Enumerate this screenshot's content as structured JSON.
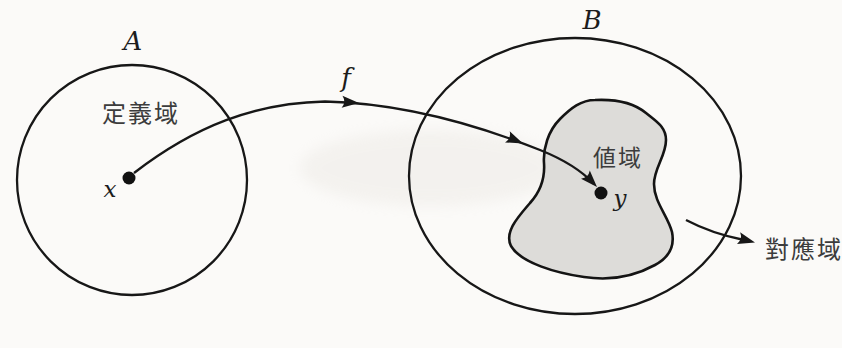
{
  "figure": {
    "type": "function-mapping-diagram",
    "set_a": {
      "name": "A",
      "region": "定義域",
      "point": "x"
    },
    "set_b": {
      "name": "B",
      "range_region": "値域",
      "point": "y",
      "codomain": "對應域"
    },
    "mapping": {
      "function": "f"
    }
  },
  "colors": {
    "background": "#fbfaf8",
    "line": "#171717",
    "range_fill": "#dddcd9",
    "cjk_text": "#3c3c3c",
    "math_text": "#1c1c1c"
  }
}
